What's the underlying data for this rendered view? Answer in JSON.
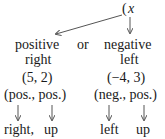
{
  "header": {
    "paren": "(",
    "var": "x"
  },
  "options": {
    "left": {
      "sign": "positive",
      "direction": "right"
    },
    "connector": "or",
    "right": {
      "sign": "negative",
      "direction": "left"
    }
  },
  "examples": [
    {
      "point": "(5, 2)",
      "signs": "(pos., pos.)",
      "dir_x": "right,",
      "dir_y": "up"
    },
    {
      "point": "(−4, 3)",
      "signs": "(neg., pos.)",
      "dir_x": "left",
      "dir_y": "up"
    }
  ],
  "colors": {
    "text": "#1a1a1a",
    "arrow": "#555555"
  }
}
